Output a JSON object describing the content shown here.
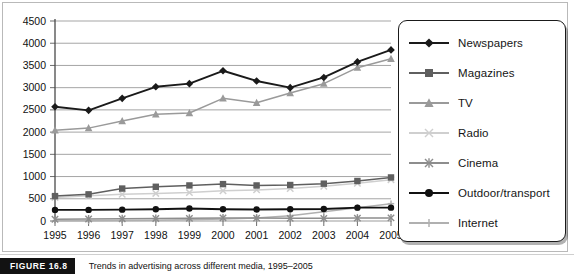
{
  "figure": {
    "tag": "FIGURE 16.8",
    "caption": "Trends in advertising across different media, 1995–2005"
  },
  "legend": {
    "position": "right",
    "items": [
      {
        "label": "Newspapers",
        "marker": "diamond",
        "color": "#1a1a1a"
      },
      {
        "label": "Magazines",
        "marker": "square",
        "color": "#5f5f5f"
      },
      {
        "label": "TV",
        "marker": "triangle",
        "color": "#9a9a9a"
      },
      {
        "label": "Radio",
        "marker": "x-light",
        "color": "#cfcfcf"
      },
      {
        "label": "Cinema",
        "marker": "asterisk",
        "color": "#8d8d8d"
      },
      {
        "label": "Outdoor/transport",
        "marker": "circle",
        "color": "#111111"
      },
      {
        "label": "Internet",
        "marker": "plus",
        "color": "#b0b0b0"
      }
    ]
  },
  "chart_data": {
    "type": "line",
    "title": "Trends in advertising across different media, 1995–2005",
    "xlabel": "",
    "ylabel": "",
    "grid": true,
    "ylim": [
      0,
      4500
    ],
    "ytick_step": 500,
    "yticks": [
      "0",
      "500",
      "1000",
      "1500",
      "2000",
      "2500",
      "3000",
      "3500",
      "4000",
      "4500"
    ],
    "categories": [
      "1995",
      "1996",
      "1997",
      "1998",
      "1999",
      "2000",
      "2001",
      "2002",
      "2003",
      "2004",
      "2005"
    ],
    "series": [
      {
        "name": "Newspapers",
        "color": "#1a1a1a",
        "marker": "diamond",
        "values": [
          2570,
          2490,
          2760,
          3020,
          3090,
          3380,
          3150,
          3000,
          3230,
          3580,
          3850
        ]
      },
      {
        "name": "Magazines",
        "color": "#5f5f5f",
        "marker": "square",
        "values": [
          560,
          600,
          730,
          770,
          800,
          830,
          800,
          810,
          840,
          900,
          980
        ]
      },
      {
        "name": "TV",
        "color": "#9a9a9a",
        "marker": "triangle",
        "values": [
          2040,
          2090,
          2250,
          2400,
          2430,
          2760,
          2660,
          2880,
          3090,
          3450,
          3650
        ]
      },
      {
        "name": "Radio",
        "color": "#cfcfcf",
        "marker": "x-light",
        "values": [
          530,
          570,
          600,
          620,
          640,
          680,
          700,
          730,
          780,
          850,
          930
        ]
      },
      {
        "name": "Cinema",
        "color": "#8d8d8d",
        "marker": "asterisk",
        "values": [
          40,
          45,
          50,
          55,
          60,
          70,
          65,
          60,
          60,
          65,
          70
        ]
      },
      {
        "name": "Outdoor/transport",
        "color": "#111111",
        "marker": "circle",
        "values": [
          250,
          250,
          255,
          265,
          280,
          265,
          260,
          265,
          270,
          300,
          300
        ]
      },
      {
        "name": "Internet",
        "color": "#b0b0b0",
        "marker": "plus",
        "values": [
          5,
          8,
          12,
          18,
          30,
          45,
          70,
          120,
          210,
          300,
          390
        ]
      }
    ]
  }
}
